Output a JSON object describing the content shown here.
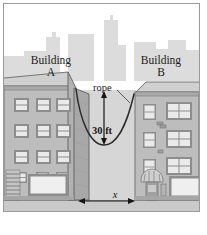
{
  "figure": {
    "kind": "geometry-word-problem-illustration",
    "border_color": "#9a9a9a",
    "background_color": "#ffffff"
  },
  "labels": {
    "building_a": "Building\nA",
    "building_b": "Building\nB",
    "rope": "rope",
    "sag_height": "30 ft",
    "distance": "x"
  },
  "annotations": {
    "sag_dimension": {
      "value": 30,
      "unit": "ft",
      "text": "30 ft",
      "orientation": "vertical",
      "arrowheads": "both"
    },
    "span_dimension": {
      "variable": "x",
      "text": "x",
      "orientation": "horizontal",
      "arrowheads": "both"
    },
    "rope_leader": {
      "label": "rope",
      "points_to": "rope-curve"
    }
  },
  "colors": {
    "sky": "#ffffff",
    "skyline": "#dcdcdc",
    "building_face": "#bdbdbd",
    "building_side": "#a8a8a8",
    "building_outline": "#6b6b6b",
    "window_fill": "#e8e8e8",
    "window_frame": "#8d8d8d",
    "ground": "#c9c9c9",
    "gap": "#d6d6d6",
    "ink": "#1a1a1a",
    "rope": "#2b2b2b"
  },
  "geometry": {
    "rope_anchor_left": [
      72,
      85
    ],
    "rope_anchor_right": [
      130,
      90
    ],
    "rope_lowest_point": [
      100,
      141
    ],
    "ground_line_y": 196,
    "span_line_y": 197,
    "span_line_x_start": 74,
    "span_line_x_end": 131
  },
  "scene": {
    "skyline_towers": 9,
    "building_a_window_columns": 3,
    "building_a_window_rows": 4,
    "building_b_window_columns": 2,
    "building_b_window_rows": 3,
    "has_fire_escape": true,
    "has_awning_entrance": true,
    "has_storefront_windows": true
  }
}
